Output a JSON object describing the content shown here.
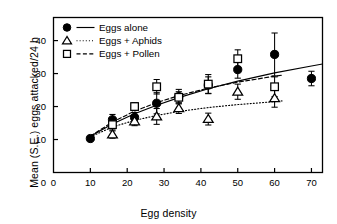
{
  "chart_data": {
    "type": "scatter",
    "title": "",
    "xlabel": "Egg density",
    "ylabel": "Mean (S.E.) eggs attacked/24 h",
    "xlim": [
      0,
      73
    ],
    "ylim": [
      0,
      47
    ],
    "xticks": [
      0,
      10,
      20,
      30,
      40,
      50,
      60,
      70
    ],
    "yticks": [
      0,
      10,
      20,
      30,
      40
    ],
    "xtick_labels": [
      "0",
      "10",
      "20",
      "30",
      "40",
      "50",
      "60",
      "70"
    ],
    "ytick_labels": [
      "0",
      "10",
      "20",
      "30",
      "40"
    ],
    "grid": false,
    "legend_position": "top-left",
    "series": [
      {
        "name": "Eggs alone",
        "marker": "filled-circle",
        "line_style": "solid",
        "x": [
          10,
          16,
          22,
          28,
          34,
          42,
          50,
          60,
          70
        ],
        "values": [
          10.3,
          16.0,
          16.7,
          21.0,
          23.0,
          26.5,
          31.2,
          35.8,
          28.5
        ],
        "errors": [
          0.6,
          1.6,
          1.5,
          3.2,
          2.2,
          2.5,
          2.6,
          6.5,
          2.2
        ],
        "fit_curve": [
          [
            10,
            11.0
          ],
          [
            16,
            14.7
          ],
          [
            22,
            17.8
          ],
          [
            28,
            20.4
          ],
          [
            34,
            22.7
          ],
          [
            42,
            25.4
          ],
          [
            50,
            27.7
          ],
          [
            60,
            30.2
          ],
          [
            70,
            32.3
          ],
          [
            73,
            32.9
          ]
        ]
      },
      {
        "name": "Eggs + Aphids",
        "marker": "open-triangle",
        "line_style": "dotted",
        "x": [
          16,
          22,
          28,
          34,
          42,
          50,
          60
        ],
        "values": [
          11.5,
          15.5,
          17.0,
          19.5,
          16.2,
          24.5,
          22.5
        ],
        "errors": [
          1.1,
          1.3,
          2.4,
          1.6,
          1.8,
          2.3,
          2.7
        ],
        "fit_curve": [
          [
            10,
            10.8
          ],
          [
            16,
            13.8
          ],
          [
            22,
            15.8
          ],
          [
            28,
            17.3
          ],
          [
            34,
            18.5
          ],
          [
            42,
            19.7
          ],
          [
            50,
            20.6
          ],
          [
            60,
            21.5
          ],
          [
            62,
            21.7
          ]
        ]
      },
      {
        "name": "Eggs + Pollen",
        "marker": "open-square",
        "line_style": "dashed",
        "x": [
          16,
          22,
          28,
          34,
          42,
          50,
          60
        ],
        "values": [
          14.5,
          20.0,
          26.0,
          22.8,
          26.8,
          34.5,
          26.0
        ],
        "errors": [
          1.6,
          1.2,
          2.2,
          1.7,
          2.9,
          2.7,
          3.0
        ],
        "fit_curve": [
          [
            10,
            11.0
          ],
          [
            16,
            15.3
          ],
          [
            22,
            18.6
          ],
          [
            28,
            21.2
          ],
          [
            34,
            23.3
          ],
          [
            42,
            25.6
          ],
          [
            50,
            27.4
          ],
          [
            60,
            29.2
          ],
          [
            62,
            29.5
          ]
        ]
      }
    ]
  },
  "legend": {
    "items": [
      {
        "label": "Eggs alone",
        "marker": "filled-circle",
        "line_style": "solid"
      },
      {
        "label": "Eggs + Aphids",
        "marker": "open-triangle",
        "line_style": "dotted"
      },
      {
        "label": "Eggs + Pollen",
        "marker": "open-square",
        "line_style": "dashed"
      }
    ]
  }
}
